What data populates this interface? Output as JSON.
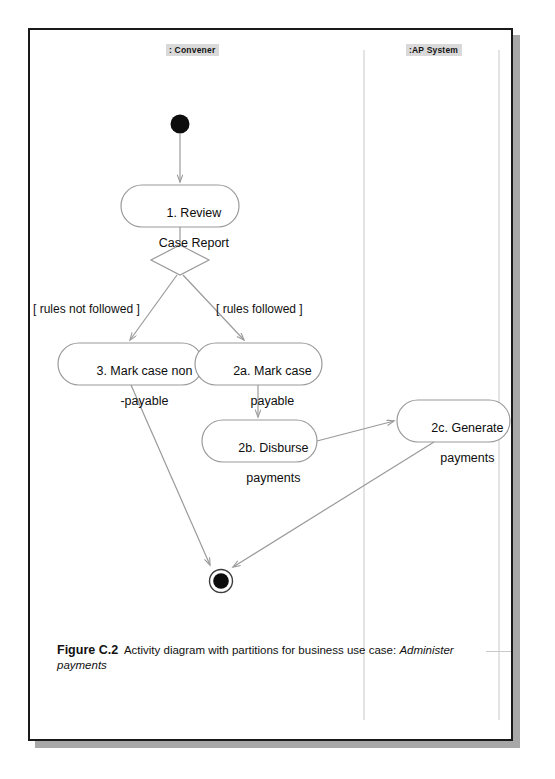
{
  "page": {
    "background_color": "#ffffff",
    "sheet_border_color": "#1a1a1a",
    "shadow_color": "#a8a8a8"
  },
  "diagram": {
    "type": "uml-activity-diagram",
    "line_color": "#9a9a9a",
    "node_fill": "#ffffff",
    "node_stroke": "#9a9a9a",
    "partitions": [
      {
        "id": "convener",
        "label": ": Convener",
        "divider_x": 334
      },
      {
        "id": "ap-system",
        "label": ":AP System",
        "divider_x": 469
      }
    ],
    "nodes": [
      {
        "id": "initial",
        "kind": "initial-node",
        "label": ""
      },
      {
        "id": "a1",
        "kind": "action",
        "line1": "1. Review",
        "line2": "Case Report"
      },
      {
        "id": "decision",
        "kind": "decision-node",
        "label": ""
      },
      {
        "id": "a3",
        "kind": "action",
        "line1": "3. Mark case non",
        "line2": "-payable"
      },
      {
        "id": "a2a",
        "kind": "action",
        "line1": "2a. Mark case",
        "line2": "payable"
      },
      {
        "id": "a2b",
        "kind": "action",
        "line1": "2b. Disburse",
        "line2": "payments"
      },
      {
        "id": "a2c",
        "kind": "action",
        "line1": "2c. Generate",
        "line2": "payments"
      },
      {
        "id": "final",
        "kind": "final-node",
        "label": ""
      }
    ],
    "guards": [
      {
        "id": "guard-not-followed",
        "label": "[ rules not followed ]"
      },
      {
        "id": "guard-followed",
        "label": "[ rules followed ]"
      }
    ],
    "edges": [
      {
        "from": "initial",
        "to": "a1"
      },
      {
        "from": "a1",
        "to": "decision"
      },
      {
        "from": "decision",
        "to": "a3",
        "guard": "[ rules not followed ]"
      },
      {
        "from": "decision",
        "to": "a2a",
        "guard": "[ rules followed ]"
      },
      {
        "from": "a2a",
        "to": "a2b"
      },
      {
        "from": "a2b",
        "to": "a2c"
      },
      {
        "from": "a3",
        "to": "final"
      },
      {
        "from": "a2c",
        "to": "final"
      }
    ]
  },
  "caption": {
    "number": "Figure C.2",
    "body": "Activity diagram with partitions for business use case: ",
    "emphasis": "Administer payments"
  }
}
